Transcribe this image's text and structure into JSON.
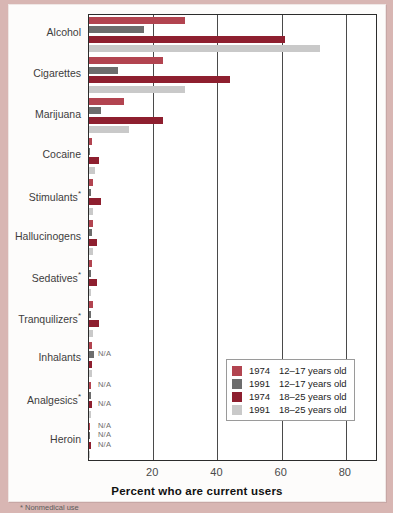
{
  "chart_data": {
    "type": "bar",
    "orientation": "horizontal",
    "title": "",
    "xlabel": "Percent who are current users",
    "ylabel": "",
    "xlim": [
      0,
      90
    ],
    "xticks": [
      20,
      40,
      60,
      80
    ],
    "grid": true,
    "legend_position": "bottom-right",
    "footnote": "* Nonmedical use",
    "categories": [
      "Alcohol",
      "Cigarettes",
      "Marijuana",
      "Cocaine",
      "Stimulants*",
      "Hallucinogens",
      "Sedatives*",
      "Tranquilizers*",
      "Inhalants",
      "Analgesics*",
      "Heroin"
    ],
    "series": [
      {
        "name": "1974  12–17 years old",
        "year": "1974",
        "age": "12–17 years old",
        "color": "#b24450",
        "values": [
          30.0,
          23.0,
          11.0,
          1.0,
          1.2,
          1.3,
          1.0,
          1.1,
          0.9,
          0.6,
          0.4
        ],
        "na": [
          false,
          false,
          false,
          false,
          false,
          false,
          false,
          false,
          false,
          true,
          true
        ]
      },
      {
        "name": "1991  12–17 years old",
        "year": "1991",
        "age": "12–17 years old",
        "color": "#6d6d6d",
        "values": [
          17.0,
          9.0,
          3.6,
          0.4,
          0.6,
          0.8,
          0.5,
          0.6,
          1.6,
          0.5,
          0.2
        ],
        "na": [
          false,
          false,
          false,
          false,
          false,
          false,
          false,
          false,
          true,
          false,
          true
        ]
      },
      {
        "name": "1974  18–25 years old",
        "year": "1974",
        "age": "18–25 years old",
        "color": "#8e1f2f",
        "values": [
          61.0,
          44.0,
          23.0,
          3.1,
          3.7,
          2.5,
          2.4,
          3.2,
          1.0,
          0.8,
          0.6
        ],
        "na": [
          false,
          false,
          false,
          false,
          false,
          false,
          false,
          false,
          false,
          true,
          true
        ]
      },
      {
        "name": "1991  18–25 years old",
        "year": "1991",
        "age": "18–25 years old",
        "color": "#c9c9c9",
        "values": [
          72.0,
          30.0,
          12.4,
          2.0,
          1.3,
          1.2,
          0.7,
          1.2,
          0.9,
          0.7,
          0.3
        ],
        "na": [
          false,
          false,
          false,
          false,
          false,
          false,
          false,
          false,
          false,
          false,
          false
        ]
      }
    ],
    "na_label": "N/A"
  },
  "legend": {
    "items": [
      {
        "year": "1974",
        "age": "12–17 years old",
        "color": "#b24450"
      },
      {
        "year": "1991",
        "age": "12–17 years old",
        "color": "#6d6d6d"
      },
      {
        "year": "1974",
        "age": "18–25 years old",
        "color": "#8e1f2f"
      },
      {
        "year": "1991",
        "age": "18–25 years old",
        "color": "#c9c9c9"
      }
    ]
  }
}
